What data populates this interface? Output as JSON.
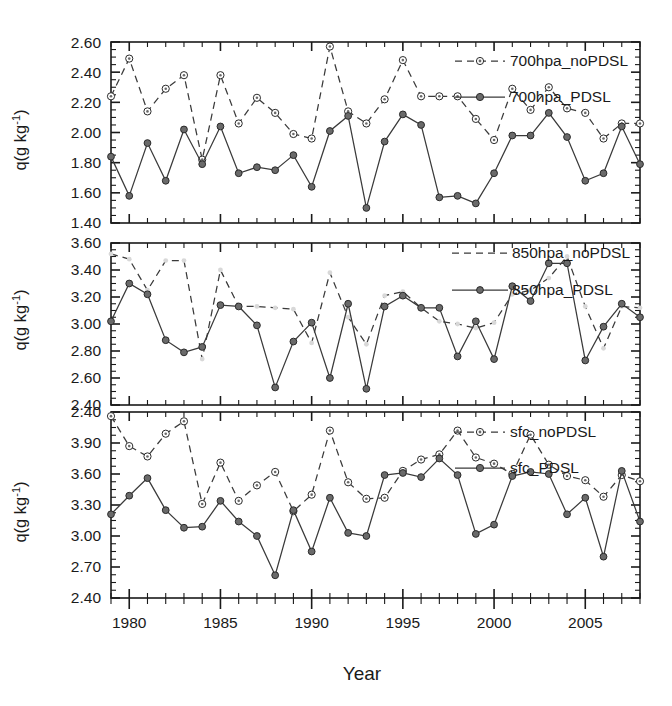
{
  "figure": {
    "xlabel": "Year",
    "panels": [
      {
        "id": "panel-700hpa",
        "ylabel_main": "q(g kg",
        "ylabel_sup": "-1",
        "ylabel_close": ")",
        "ylim": [
          1.4,
          2.6
        ],
        "yticks": [
          "1.40",
          "1.60",
          "1.80",
          "2.00",
          "2.20",
          "2.40",
          "2.60"
        ],
        "legend": [
          {
            "label": "700hpa_noPDSL",
            "style": "dashed-open"
          },
          {
            "label": "700hpa_PDSL",
            "style": "solid-filled"
          }
        ]
      },
      {
        "id": "panel-850hpa",
        "ylabel_main": "q(g kg",
        "ylabel_sup": "-1",
        "ylabel_close": ")",
        "ylim": [
          2.4,
          3.6
        ],
        "yticks": [
          "2.40",
          "2.60",
          "2.80",
          "3.00",
          "3.20",
          "3.40",
          "3.60"
        ],
        "legend": [
          {
            "label": "850hpa_noPDSL",
            "style": "dashed-open"
          },
          {
            "label": "850hpa_PDSL",
            "style": "solid-filled"
          }
        ]
      },
      {
        "id": "panel-sfc",
        "ylabel_main": "q(g kg",
        "ylabel_sup": "-1",
        "ylabel_close": ")",
        "ylim": [
          2.4,
          4.2
        ],
        "yticks": [
          "2.40",
          "2.70",
          "3.00",
          "3.30",
          "3.60",
          "3.90",
          "2.40"
        ],
        "legend": [
          {
            "label": "sfc_noPDSL",
            "style": "dashed-open"
          },
          {
            "label": "sfc_PDSL",
            "style": "solid-filled"
          }
        ]
      }
    ],
    "xticks": [
      "1980",
      "1985",
      "1990",
      "1995",
      "2000",
      "2005"
    ],
    "xlim": [
      1979,
      2008
    ]
  },
  "chart_data": [
    {
      "type": "line",
      "title": "700hpa specific humidity",
      "xlabel": "Year",
      "ylabel": "q(g kg-1)",
      "xlim": [
        1979,
        2008
      ],
      "ylim": [
        1.4,
        2.6
      ],
      "grid": false,
      "legend_position": "top-right",
      "x": [
        1979,
        1980,
        1981,
        1982,
        1983,
        1984,
        1985,
        1986,
        1987,
        1988,
        1989,
        1990,
        1991,
        1992,
        1993,
        1994,
        1995,
        1996,
        1997,
        1998,
        1999,
        2000,
        2001,
        2002,
        2003,
        2004,
        2005,
        2006,
        2007,
        2008
      ],
      "series": [
        {
          "name": "700hpa_noPDSL",
          "style": "dashed",
          "marker": "open-circle",
          "values": [
            2.24,
            2.49,
            2.14,
            2.29,
            2.38,
            1.82,
            2.38,
            2.06,
            2.23,
            2.13,
            1.99,
            1.96,
            2.57,
            2.14,
            2.06,
            2.22,
            2.48,
            2.24,
            2.24,
            2.24,
            2.09,
            1.95,
            2.29,
            2.15,
            2.3,
            2.16,
            2.13,
            1.96,
            2.06,
            2.06
          ]
        },
        {
          "name": "700hpa_PDSL",
          "style": "solid",
          "marker": "filled-circle",
          "values": [
            1.84,
            1.58,
            1.93,
            1.68,
            2.02,
            1.79,
            2.04,
            1.73,
            1.77,
            1.75,
            1.85,
            1.64,
            2.01,
            2.11,
            1.5,
            1.94,
            2.12,
            2.05,
            1.57,
            1.58,
            1.53,
            1.73,
            1.98,
            1.98,
            2.13,
            1.97,
            1.68,
            1.73,
            2.04,
            1.79
          ]
        }
      ]
    },
    {
      "type": "line",
      "title": "850hpa specific humidity",
      "xlabel": "Year",
      "ylabel": "q(g kg-1)",
      "xlim": [
        1979,
        2008
      ],
      "ylim": [
        2.4,
        3.6
      ],
      "grid": false,
      "legend_position": "top-right",
      "x": [
        1979,
        1980,
        1981,
        1982,
        1983,
        1984,
        1985,
        1986,
        1987,
        1988,
        1989,
        1990,
        1991,
        1992,
        1993,
        1994,
        1995,
        1996,
        1997,
        1998,
        1999,
        2000,
        2001,
        2002,
        2003,
        2004,
        2005,
        2006,
        2007,
        2008
      ],
      "series": [
        {
          "name": "850hpa_noPDSL",
          "style": "dashed",
          "marker": "none",
          "values": [
            3.52,
            3.48,
            3.25,
            3.47,
            3.47,
            2.74,
            3.4,
            3.13,
            3.13,
            3.12,
            3.11,
            2.86,
            3.38,
            3.05,
            2.85,
            3.21,
            3.24,
            3.12,
            3.02,
            3.0,
            2.97,
            3.01,
            3.22,
            3.25,
            3.34,
            3.5,
            3.13,
            2.82,
            3.13,
            3.12
          ]
        },
        {
          "name": "850hpa_PDSL",
          "style": "solid",
          "marker": "filled-circle",
          "values": [
            3.02,
            3.3,
            3.22,
            2.88,
            2.79,
            2.83,
            3.14,
            3.13,
            2.99,
            2.53,
            2.87,
            3.01,
            2.6,
            3.15,
            2.52,
            3.13,
            3.21,
            3.12,
            3.12,
            2.76,
            3.02,
            2.74,
            3.28,
            3.17,
            3.45,
            3.45,
            2.73,
            2.98,
            3.15,
            3.05
          ]
        }
      ]
    },
    {
      "type": "line",
      "title": "surface specific humidity",
      "xlabel": "Year",
      "ylabel": "q(g kg-1)",
      "xlim": [
        1979,
        2008
      ],
      "ylim": [
        2.4,
        4.2
      ],
      "grid": false,
      "legend_position": "top-right",
      "x": [
        1979,
        1980,
        1981,
        1982,
        1983,
        1984,
        1985,
        1986,
        1987,
        1988,
        1989,
        1990,
        1991,
        1992,
        1993,
        1994,
        1995,
        1996,
        1997,
        1998,
        1999,
        2000,
        2001,
        2002,
        2003,
        2004,
        2005,
        2006,
        2007,
        2008
      ],
      "series": [
        {
          "name": "sfc_noPDSL",
          "style": "dashed",
          "marker": "open-circle",
          "values": [
            4.16,
            3.87,
            3.77,
            3.99,
            4.11,
            3.31,
            3.71,
            3.34,
            3.49,
            3.62,
            3.24,
            3.4,
            4.02,
            3.52,
            3.36,
            3.37,
            3.63,
            3.74,
            3.79,
            4.02,
            3.76,
            3.7,
            3.6,
            3.98,
            3.69,
            3.58,
            3.54,
            3.38,
            3.59,
            3.53
          ]
        },
        {
          "name": "sfc_PDSL",
          "style": "solid",
          "marker": "filled-circle",
          "values": [
            3.21,
            3.39,
            3.56,
            3.25,
            3.08,
            3.09,
            3.34,
            3.14,
            3.0,
            2.62,
            3.25,
            2.85,
            3.37,
            3.03,
            3.0,
            3.59,
            3.61,
            3.57,
            3.75,
            3.59,
            3.02,
            3.11,
            3.58,
            3.62,
            3.6,
            3.21,
            3.37,
            2.8,
            3.63,
            3.14
          ]
        }
      ]
    }
  ]
}
